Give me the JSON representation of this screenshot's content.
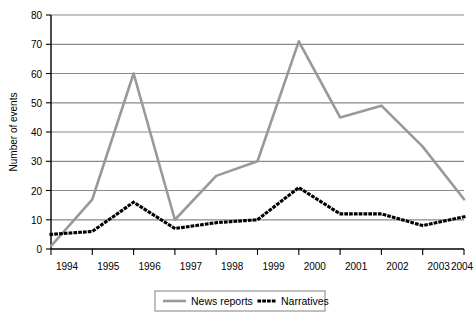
{
  "chart_data": {
    "type": "line",
    "title": "",
    "subtitle": "",
    "xlabel": "",
    "ylabel": "Number of events",
    "categories": [
      "1994",
      "1995",
      "1996",
      "1997",
      "1998",
      "1999",
      "2000",
      "2001",
      "2002",
      "2003",
      "2004"
    ],
    "x": [
      1994,
      1995,
      1996,
      1997,
      1998,
      1999,
      2000,
      2001,
      2002,
      2003,
      2004
    ],
    "series": [
      {
        "name": "News reports",
        "color": "#999999",
        "style": "solid",
        "values": [
          1,
          17,
          60,
          10,
          25,
          30,
          71,
          45,
          49,
          35,
          17
        ]
      },
      {
        "name": "Narratives",
        "color": "#000000",
        "style": "dotted",
        "values": [
          5,
          6,
          16,
          7,
          9,
          10,
          21,
          12,
          12,
          8,
          11
        ]
      }
    ],
    "ylim": [
      0,
      80
    ],
    "yticks": [
      0,
      10,
      20,
      30,
      40,
      50,
      60,
      70,
      80
    ],
    "ytick_labels": [
      "0",
      "10",
      "20",
      "30",
      "40",
      "50",
      "60",
      "70",
      "80"
    ],
    "grid": true,
    "grid_axis": "y",
    "legend_position": "bottom-center",
    "legend": [
      "News reports",
      "Narratives"
    ]
  },
  "legend": {
    "entries": [
      {
        "label": "News reports",
        "marker": "solid-line-swatch"
      },
      {
        "label": "Narratives",
        "marker": "dotted-line-swatch"
      }
    ]
  },
  "axes": {
    "y_title": "Number of events"
  },
  "colors": {
    "news_reports": "#999999",
    "narratives": "#000000",
    "gridline": "#808080",
    "axis": "#000000",
    "background": "#ffffff"
  }
}
